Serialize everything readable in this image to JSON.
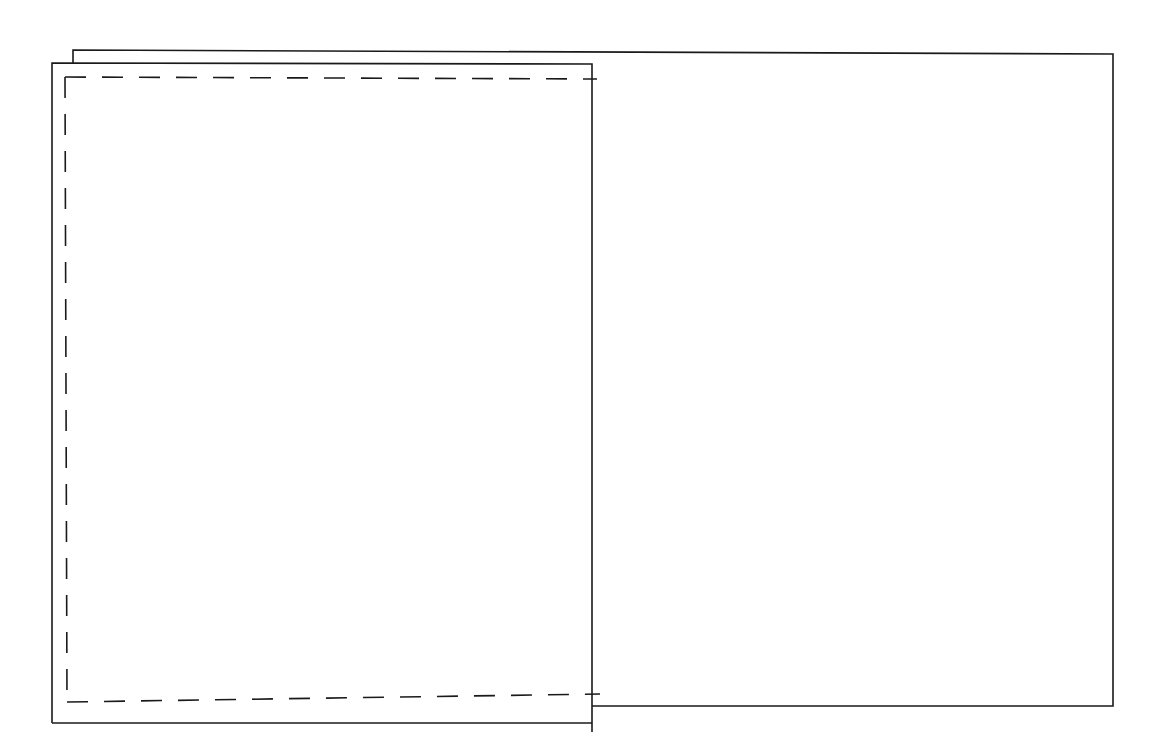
{
  "diagram": {
    "colors": {
      "stroke": "#1a1a1a",
      "background": "#ffffff"
    },
    "shapes": {
      "back_rect": {
        "x1": 73,
        "y1": 50,
        "x2": 1113,
        "y2": 706
      },
      "front_rect": {
        "x1": 52,
        "y1": 63,
        "x2": 592,
        "y2": 723
      },
      "dashed_rect": {
        "x1": 65,
        "y1": 77,
        "x2": 600,
        "y2": 694
      }
    }
  }
}
